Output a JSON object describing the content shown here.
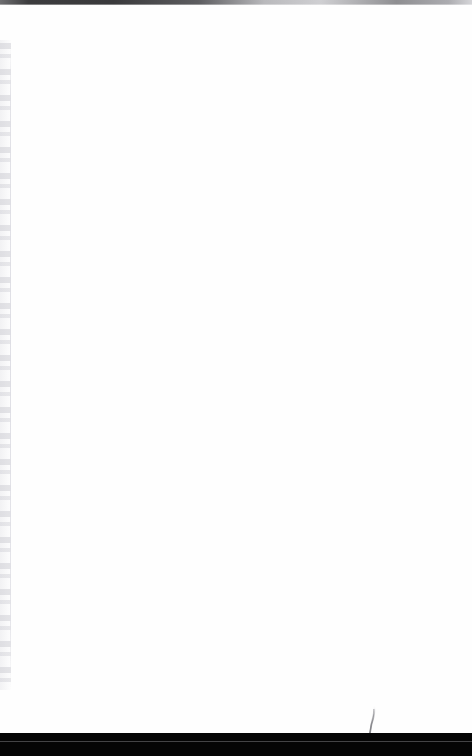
{
  "document": {
    "kind": "scanned-page",
    "page_state": "blank",
    "width_px": 472,
    "height_px": 756,
    "body_text": "",
    "paper_color": "#fefefe"
  },
  "top_edge": {
    "label": "scanner-bed-edge",
    "color_dark": "#3a3a3c",
    "color_light": "#d6d6d9",
    "height_px": 5
  },
  "gutter": {
    "label": "binding-gutter",
    "note": "faint vertical bleed-through marks, not legible",
    "color": "#f2f2f4",
    "crease_color": "#e0e0e6",
    "width_px": 11,
    "top_px": 40,
    "height_px": 650
  },
  "bottom_band": {
    "label": "page-edge-shadow",
    "color": "#050505",
    "seam_color": "#76767a",
    "top_px": 733,
    "height_px": 23
  },
  "artifact": {
    "label": "needle-streak",
    "color": "#9a9a9e",
    "left_px": 362,
    "top_px": 703
  }
}
